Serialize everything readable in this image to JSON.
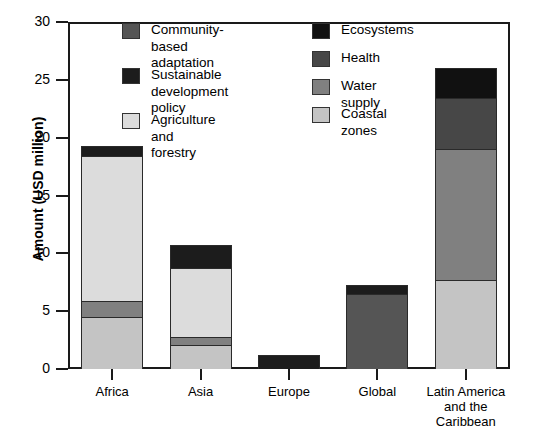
{
  "chart_data": {
    "type": "bar",
    "subtype": "stacked-bar",
    "title": "",
    "xlabel": "",
    "ylabel": "Amount (USD million)",
    "ylim": [
      0,
      30
    ],
    "yticks": [
      0,
      5,
      10,
      15,
      20,
      25,
      30
    ],
    "grid": false,
    "legend_position": "inside-top",
    "categories": [
      "Africa",
      "Asia",
      "Europe",
      "Global",
      "Latin America and the Caribbean"
    ],
    "series": [
      {
        "name": "Community-based adaptation",
        "color": "#555555",
        "values": [
          0,
          0,
          0,
          6.5,
          0
        ]
      },
      {
        "name": "Sustainable development policy",
        "color": "#1c1c1c",
        "values": [
          0.9,
          2.0,
          1.2,
          0.8,
          0
        ]
      },
      {
        "name": "Agriculture and forestry",
        "color": "#dcdcdc",
        "values": [
          12.5,
          5.9,
          0,
          0,
          0
        ]
      },
      {
        "name": "Ecosystems",
        "color": "#111111",
        "values": [
          0,
          0,
          0,
          0,
          2.6
        ]
      },
      {
        "name": "Health",
        "color": "#474747",
        "values": [
          0,
          0,
          0,
          0,
          4.4
        ]
      },
      {
        "name": "Water supply",
        "color": "#808080",
        "values": [
          1.4,
          0.7,
          0,
          0,
          11.3
        ]
      },
      {
        "name": "Coastal zones",
        "color": "#c4c4c4",
        "values": [
          4.5,
          2.1,
          0,
          0,
          7.7
        ]
      }
    ],
    "category_totals": [
      19.3,
      10.0,
      1.2,
      7.3,
      26.0
    ]
  },
  "axis": {
    "y_title": "Amount (USD million)",
    "y_tick_labels": [
      "0",
      "5",
      "10",
      "15",
      "20",
      "25",
      "30"
    ],
    "x_tick_labels": [
      "Africa",
      "Asia",
      "Europe",
      "Global",
      "Latin America\nand the\nCaribbean"
    ]
  },
  "legend": {
    "left_column": [
      {
        "label": "Community-based\nadaptation",
        "color": "#555555"
      },
      {
        "label": "Sustainable\ndevelopment policy",
        "color": "#1c1c1c"
      },
      {
        "label": "Agriculture and forestry",
        "color": "#dcdcdc"
      }
    ],
    "right_column": [
      {
        "label": "Ecosystems",
        "color": "#111111"
      },
      {
        "label": "Health",
        "color": "#474747"
      },
      {
        "label": "Water supply",
        "color": "#808080"
      },
      {
        "label": "Coastal zones",
        "color": "#c4c4c4"
      }
    ]
  }
}
